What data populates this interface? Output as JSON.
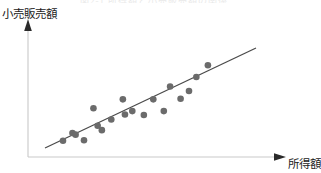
{
  "figure": {
    "title_remnant": "図2-1 所得額と小売販売額の関係",
    "y_axis_label": "小売販売額",
    "x_axis_label": "所得額",
    "axis_color": "#c9c9c9",
    "arrow_color": "#2a2a2a",
    "point_color": "#6b6b6b",
    "line_color": "#4a4a4a",
    "background": "#ffffff"
  },
  "chart_data": {
    "type": "scatter",
    "title": "図2-1 所得額と小売販売額の関係",
    "xlabel": "所得額",
    "ylabel": "小売販売額",
    "grid": false,
    "legend": false,
    "axis_style": "arrow-axes-no-ticks",
    "xlim": [
      0,
      100
    ],
    "ylim": [
      0,
      100
    ],
    "points": [
      {
        "x": 10.0,
        "y": 10.0
      },
      {
        "x": 14.5,
        "y": 17.0
      },
      {
        "x": 16.0,
        "y": 15.5
      },
      {
        "x": 20.0,
        "y": 10.5
      },
      {
        "x": 24.5,
        "y": 39.0
      },
      {
        "x": 26.5,
        "y": 23.5
      },
      {
        "x": 28.5,
        "y": 19.5
      },
      {
        "x": 33.0,
        "y": 29.0
      },
      {
        "x": 38.5,
        "y": 47.0
      },
      {
        "x": 39.5,
        "y": 33.5
      },
      {
        "x": 43.0,
        "y": 36.5
      },
      {
        "x": 48.5,
        "y": 33.0
      },
      {
        "x": 53.0,
        "y": 47.0
      },
      {
        "x": 58.0,
        "y": 36.5
      },
      {
        "x": 61.0,
        "y": 58.5
      },
      {
        "x": 66.0,
        "y": 47.5
      },
      {
        "x": 70.0,
        "y": 54.5
      },
      {
        "x": 73.5,
        "y": 67.0
      },
      {
        "x": 79.0,
        "y": 77.5
      }
    ],
    "trend_line": {
      "kind": "linear-fit",
      "x_start": 7.0,
      "y_start": 9.0,
      "x_end": 85.0,
      "y_end": 82.0,
      "direction": "positive",
      "description": "右上がりの直線（正の相関）"
    }
  }
}
